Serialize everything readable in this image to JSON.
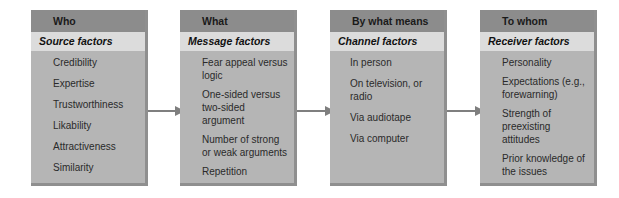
{
  "boxes": [
    {
      "header": "Who",
      "subheader": "Source factors",
      "items": [
        "Credibility",
        "Expertise",
        "Trustworthiness",
        "Likability",
        "Attractiveness",
        "Similarity"
      ]
    },
    {
      "header": "What",
      "subheader": "Message factors",
      "items": [
        "Fear appeal versus logic",
        "One-sided versus two-sided argument",
        "Number of strong or weak arguments",
        "Repetition"
      ]
    },
    {
      "header": "By what means",
      "subheader": "Channel factors",
      "items": [
        "In person",
        "On television, or radio",
        "Via audiotape",
        "Via computer"
      ]
    },
    {
      "header": "To whom",
      "subheader": "Receiver factors",
      "items": [
        "Personality",
        "Expectations (e.g., forewarning)",
        "Strength of preexisting attitudes",
        "Prior knowledge of the issues"
      ]
    }
  ],
  "colors": {
    "header_bg": "#8c8c8c",
    "subheader_bg": "#dcdcdc",
    "body_bg": "#b5b5b5",
    "arrow": "#7f7f7f"
  }
}
